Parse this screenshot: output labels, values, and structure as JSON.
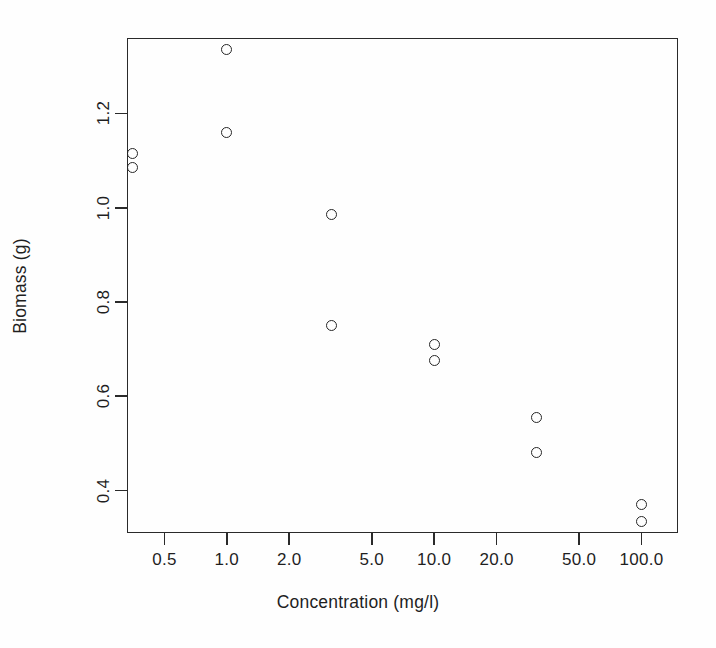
{
  "chart_data": {
    "type": "scatter",
    "title": "",
    "xlabel": "Concentration (mg/l)",
    "ylabel": "Biomass (g)",
    "xscale": "log",
    "yscale": "linear",
    "xlim": [
      0.33,
      150.0
    ],
    "ylim": [
      0.31,
      1.36
    ],
    "grid": false,
    "legend": null,
    "xticks": [
      0.5,
      1.0,
      2.0,
      5.0,
      10.0,
      20.0,
      50.0,
      100.0
    ],
    "xticklabels": [
      "0.5",
      "1.0",
      "2.0",
      "5.0",
      "10.0",
      "20.0",
      "50.0",
      "100.0"
    ],
    "yticks": [
      0.4,
      0.6,
      0.8,
      1.0,
      1.2
    ],
    "yticklabels": [
      "0.4",
      "0.6",
      "0.8",
      "1.0",
      "1.2"
    ],
    "marker": "open-circle",
    "marker_color": "#262626",
    "points": [
      {
        "x": 0.35,
        "y": 1.115
      },
      {
        "x": 0.35,
        "y": 1.085
      },
      {
        "x": 1.0,
        "y": 1.335
      },
      {
        "x": 1.0,
        "y": 1.16
      },
      {
        "x": 3.2,
        "y": 0.985
      },
      {
        "x": 3.2,
        "y": 0.75
      },
      {
        "x": 10.0,
        "y": 0.71
      },
      {
        "x": 10.0,
        "y": 0.675
      },
      {
        "x": 31.0,
        "y": 0.555
      },
      {
        "x": 31.0,
        "y": 0.48
      },
      {
        "x": 100.0,
        "y": 0.37
      },
      {
        "x": 100.0,
        "y": 0.335
      }
    ]
  },
  "figure": {
    "background_color": "#fefefe",
    "axis_color": "#2a2a2a"
  }
}
